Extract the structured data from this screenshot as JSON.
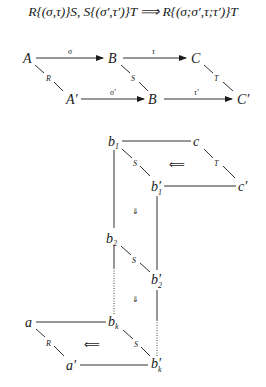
{
  "title": {
    "formula": "R{(σ,τ)}S, S{(σ′,τ′)}T ⟹ R{(σ;σ′,τ;τ′)}T"
  },
  "top_diagram": {
    "nodes": {
      "A": "A",
      "B_top": "B",
      "C": "C",
      "A_prime": "A′",
      "B_bottom": "B",
      "C_prime": "C′"
    },
    "edges": {
      "A_to_B": "σ",
      "B_to_C": "τ",
      "A_prime_to_B": "σ′",
      "B_to_C_prime": "τ′",
      "A_A_prime": "R",
      "B_B": "S",
      "C_C_prime": "T"
    }
  },
  "bottom_diagram": {
    "nodes": {
      "b1": "b",
      "b1_sub": "1",
      "c": "c",
      "b1_prime": "b′",
      "b1_prime_sub": "1",
      "c_prime": "c′",
      "b2": "b",
      "b2_sub": "2",
      "b2_prime": "b′",
      "b2_prime_sub": "2",
      "bk": "b",
      "bk_sub": "k",
      "bk_prime": "b′",
      "bk_prime_sub": "k",
      "a": "a",
      "a_prime": "a′"
    },
    "edge_labels": {
      "b1_b1p": "S",
      "c_cp": "T",
      "b2_b2p": "S",
      "bk_bkp": "S",
      "a_ap": "R"
    },
    "cells": {
      "top_2cell": "⟸",
      "down_1": "⇓",
      "down_2": "⇓",
      "bottom_2cell": "⟸"
    }
  }
}
